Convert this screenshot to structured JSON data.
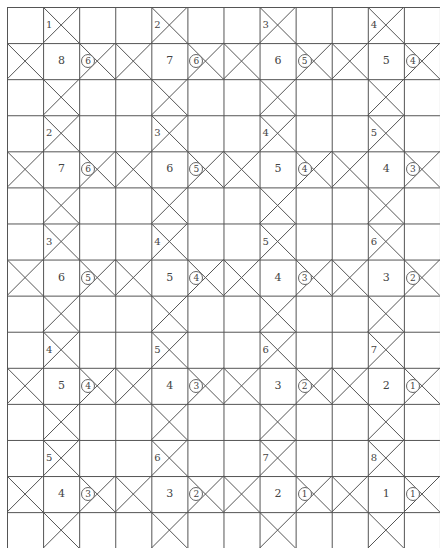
{
  "grid": {
    "columns": 12,
    "rows": 15,
    "cell_size": 36.08,
    "line_color": "#555555",
    "block_columns": [
      1,
      4,
      7,
      10
    ]
  },
  "blocks": [
    {
      "row_block": 0,
      "groups": [
        {
          "top_label": "1",
          "main_number": "8",
          "circled": "6"
        },
        {
          "top_label": "2",
          "main_number": "7",
          "circled": "6"
        },
        {
          "top_label": "3",
          "main_number": "6",
          "circled": "5"
        },
        {
          "top_label": "4",
          "main_number": "5",
          "circled": "4"
        }
      ]
    },
    {
      "row_block": 1,
      "groups": [
        {
          "top_label": "2",
          "main_number": "7",
          "circled": "6"
        },
        {
          "top_label": "3",
          "main_number": "6",
          "circled": "5"
        },
        {
          "top_label": "4",
          "main_number": "5",
          "circled": "4"
        },
        {
          "top_label": "5",
          "main_number": "4",
          "circled": "3"
        }
      ]
    },
    {
      "row_block": 2,
      "groups": [
        {
          "top_label": "3",
          "main_number": "6",
          "circled": "5"
        },
        {
          "top_label": "4",
          "main_number": "5",
          "circled": "4"
        },
        {
          "top_label": "5",
          "main_number": "4",
          "circled": "3"
        },
        {
          "top_label": "6",
          "main_number": "3",
          "circled": "2"
        }
      ]
    },
    {
      "row_block": 3,
      "groups": [
        {
          "top_label": "4",
          "main_number": "5",
          "circled": "4"
        },
        {
          "top_label": "5",
          "main_number": "4",
          "circled": "3"
        },
        {
          "top_label": "6",
          "main_number": "3",
          "circled": "2"
        },
        {
          "top_label": "7",
          "main_number": "2",
          "circled": "1"
        }
      ]
    },
    {
      "row_block": 4,
      "groups": [
        {
          "top_label": "5",
          "main_number": "4",
          "circled": "3"
        },
        {
          "top_label": "6",
          "main_number": "3",
          "circled": "2"
        },
        {
          "top_label": "7",
          "main_number": "2",
          "circled": "1"
        },
        {
          "top_label": "8",
          "main_number": "1",
          "circled": "1"
        }
      ]
    }
  ]
}
